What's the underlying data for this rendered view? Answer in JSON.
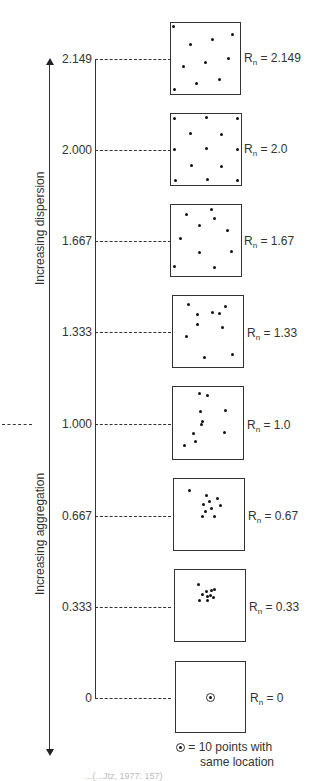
{
  "figure": {
    "axis": {
      "dispersion_label": "Increasing dispersion",
      "aggregation_label": "Increasing aggregation",
      "ticks": [
        "2.149",
        "2.000",
        "1.667",
        "1.333",
        "1.000",
        "0.667",
        "0.333",
        "0"
      ]
    },
    "panels": [
      {
        "rn_prefix": "R",
        "rn_sub": "n",
        "rn_value": " = 2.149"
      },
      {
        "rn_prefix": "R",
        "rn_sub": "n",
        "rn_value": " = 2.0"
      },
      {
        "rn_prefix": "R",
        "rn_sub": "n",
        "rn_value": " = 1.67"
      },
      {
        "rn_prefix": "R",
        "rn_sub": "n",
        "rn_value": " = 1.33"
      },
      {
        "rn_prefix": "R",
        "rn_sub": "n",
        "rn_value": " = 1.0"
      },
      {
        "rn_prefix": "R",
        "rn_sub": "n",
        "rn_value": " = 0.67"
      },
      {
        "rn_prefix": "R",
        "rn_sub": "n",
        "rn_value": " = 0.33"
      },
      {
        "rn_prefix": "R",
        "rn_sub": "n",
        "rn_value": " = 0"
      }
    ],
    "legend": {
      "line1": " = 10 points with",
      "line2": "same location",
      "symbol": "circled-dot-icon"
    },
    "caption": "...(...Jtz, 1977: 157)"
  }
}
